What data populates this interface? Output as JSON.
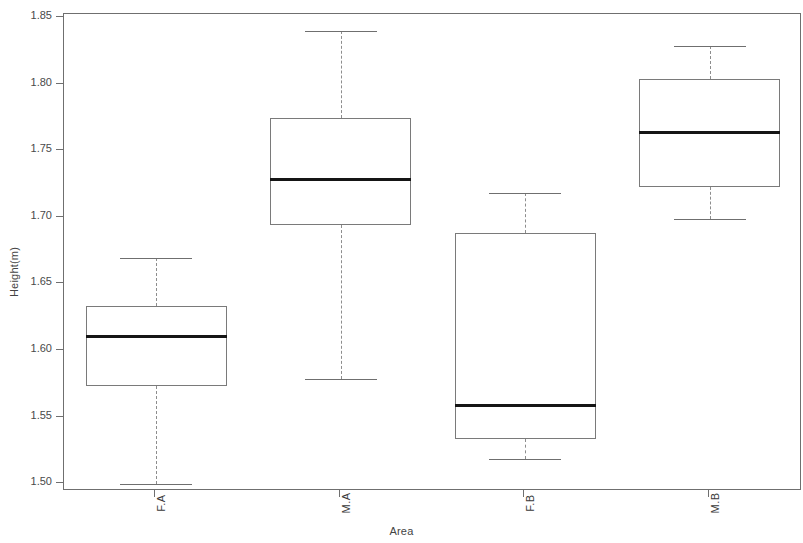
{
  "chart_data": {
    "type": "box",
    "title": "",
    "xlabel": "Area",
    "ylabel": "Height(m)",
    "categories": [
      "F.A",
      "M.A",
      "F.B",
      "M.B"
    ],
    "ylim": [
      1.495,
      1.853
    ],
    "yticks": [
      1.5,
      1.55,
      1.6,
      1.65,
      1.7,
      1.75,
      1.8,
      1.85
    ],
    "ytick_labels": [
      "1.50",
      "1.55",
      "1.60",
      "1.65",
      "1.70",
      "1.75",
      "1.80",
      "1.85"
    ],
    "grid": false,
    "legend": null,
    "boxes": [
      {
        "category": "F.A",
        "whisker_low": 1.5,
        "q1": 1.574,
        "median": 1.611,
        "q3": 1.634,
        "whisker_high": 1.67
      },
      {
        "category": "M.A",
        "whisker_low": 1.579,
        "q1": 1.695,
        "median": 1.729,
        "q3": 1.775,
        "whisker_high": 1.84
      },
      {
        "category": "F.B",
        "whisker_low": 1.519,
        "q1": 1.534,
        "median": 1.559,
        "q3": 1.689,
        "whisker_high": 1.719
      },
      {
        "category": "M.B",
        "whisker_low": 1.699,
        "q1": 1.723,
        "median": 1.764,
        "q3": 1.804,
        "whisker_high": 1.829
      }
    ],
    "colors": {
      "box_border": "#7a7a7a",
      "median": "#151515",
      "whisker": "#8d8d8d",
      "frame": "#6f6f6f",
      "background": "#ffffff",
      "text": "#3a3a3a"
    }
  }
}
